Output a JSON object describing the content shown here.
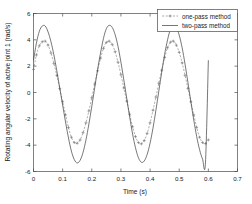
{
  "chart_data": {
    "type": "line",
    "title": "",
    "xlabel": "Time (s)",
    "ylabel": "Rotating angular velocity of active joint 1 (rad/s)",
    "xlim": [
      0,
      0.7
    ],
    "ylim": [
      -6,
      6
    ],
    "xticks": [
      "0",
      "0.1",
      "0.2",
      "0.3",
      "0.4",
      "0.5",
      "0.6",
      "0.7"
    ],
    "xtick_values": [
      0,
      0.1,
      0.2,
      0.3,
      0.4,
      0.5,
      0.6,
      0.7
    ],
    "yticks": [
      "6",
      "4",
      "2",
      "0",
      "-2",
      "-4",
      "-6"
    ],
    "ytick_values": [
      6,
      4,
      2,
      0,
      -2,
      -4,
      -6
    ],
    "grid": false,
    "legend_position": "top-right",
    "legend": [
      "one-pass method",
      "two-pass method"
    ],
    "series": [
      {
        "name": "one-pass method",
        "style": "dashed-with-plus-markers",
        "color": "#6e6e6e",
        "marker": "+",
        "x": [
          0.0,
          0.01,
          0.02,
          0.03,
          0.04,
          0.05,
          0.06,
          0.07,
          0.08,
          0.09,
          0.1,
          0.11,
          0.12,
          0.13,
          0.14,
          0.15,
          0.16,
          0.17,
          0.18,
          0.19,
          0.2,
          0.21,
          0.22,
          0.23,
          0.24,
          0.25,
          0.26,
          0.27,
          0.28,
          0.29,
          0.3,
          0.31,
          0.32,
          0.33,
          0.34,
          0.35,
          0.36,
          0.37,
          0.38,
          0.39,
          0.4,
          0.41,
          0.42,
          0.43,
          0.44,
          0.45,
          0.46,
          0.47,
          0.48,
          0.49,
          0.5,
          0.51,
          0.52,
          0.53,
          0.54,
          0.55,
          0.56,
          0.57,
          0.58,
          0.59,
          0.6
        ],
        "y": [
          1.75,
          2.85,
          3.55,
          3.85,
          3.9,
          3.6,
          3.0,
          2.2,
          1.3,
          0.3,
          -0.7,
          -1.7,
          -2.65,
          -3.4,
          -3.8,
          -3.85,
          -3.6,
          -3.05,
          -2.3,
          -1.4,
          -0.4,
          0.65,
          1.65,
          2.6,
          3.35,
          3.8,
          3.9,
          3.65,
          3.1,
          2.3,
          1.35,
          0.35,
          -0.65,
          -1.65,
          -2.6,
          -3.35,
          -3.8,
          -3.9,
          -3.65,
          -3.1,
          -2.3,
          -1.35,
          -0.35,
          0.7,
          1.7,
          2.65,
          3.4,
          3.82,
          3.9,
          3.6,
          3.05,
          2.25,
          1.3,
          0.3,
          -0.7,
          -1.7,
          -2.65,
          -3.4,
          -3.8,
          -3.88,
          -3.6
        ]
      },
      {
        "name": "two-pass method",
        "style": "solid",
        "color": "#3c3c3c",
        "marker": "none",
        "x": [
          0.0,
          0.01,
          0.02,
          0.03,
          0.04,
          0.05,
          0.06,
          0.07,
          0.08,
          0.09,
          0.1,
          0.11,
          0.12,
          0.13,
          0.14,
          0.15,
          0.16,
          0.17,
          0.18,
          0.19,
          0.2,
          0.21,
          0.22,
          0.23,
          0.24,
          0.25,
          0.26,
          0.27,
          0.28,
          0.29,
          0.3,
          0.31,
          0.32,
          0.33,
          0.34,
          0.35,
          0.36,
          0.37,
          0.38,
          0.39,
          0.4,
          0.41,
          0.42,
          0.43,
          0.44,
          0.45,
          0.46,
          0.47,
          0.48,
          0.49,
          0.5,
          0.51,
          0.52,
          0.53,
          0.54,
          0.55,
          0.56,
          0.57,
          0.58,
          0.59,
          0.6
        ],
        "y": [
          2.45,
          3.75,
          4.65,
          5.05,
          5.05,
          4.6,
          3.85,
          2.85,
          1.65,
          0.35,
          -0.95,
          -2.25,
          -3.45,
          -4.45,
          -5.1,
          -5.35,
          -5.15,
          -4.55,
          -3.6,
          -2.4,
          -1.05,
          0.35,
          1.75,
          3.0,
          4.1,
          4.85,
          5.1,
          4.95,
          4.4,
          3.5,
          2.3,
          0.95,
          -0.45,
          -1.85,
          -3.15,
          -4.2,
          -4.95,
          -5.3,
          -5.2,
          -4.7,
          -3.85,
          -2.7,
          -1.35,
          0.1,
          1.55,
          2.9,
          4.0,
          4.8,
          5.1,
          4.95,
          4.35,
          3.4,
          2.15,
          0.75,
          -0.7,
          -2.1,
          -3.35,
          -4.35,
          -5.05,
          -5.35,
          2.45
        ]
      }
    ]
  },
  "axes": {
    "ylabel_text": "Rotating angular velocity of active joint 1 (rad/s)",
    "xlabel_text": "Time (s)"
  },
  "legend": {
    "item1": "one-pass method",
    "item2": "two-pass method"
  },
  "colors": {
    "solid_series": "#3c3c3c",
    "marked_series": "#6e6e6e",
    "axis": "#4a4a4a",
    "text": "#1a1a1a",
    "background": "#ffffff"
  }
}
